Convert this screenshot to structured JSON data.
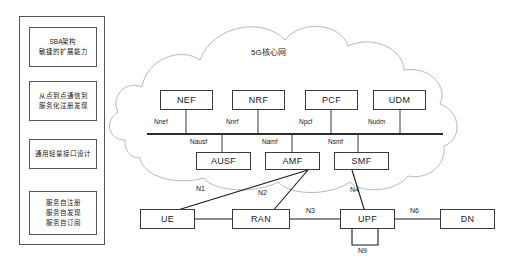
{
  "diagram": {
    "cloud_label": "5G核心网",
    "stroke_color": "#3a3a3a",
    "cloud_color": "#b9b9b9"
  },
  "side_panel": {
    "items": [
      {
        "text": "SBA架构\n敏捷的扩展能力"
      },
      {
        "text": "从点到点通信到\n服务化注册发现"
      },
      {
        "text": "通用轻量接口设计"
      },
      {
        "text": "服务自注册\n服务自发现\n服务自订阅"
      }
    ]
  },
  "core_network": {
    "top_functions": [
      {
        "name": "NEF",
        "interface": "Nnef"
      },
      {
        "name": "NRF",
        "interface": "Nnrf"
      },
      {
        "name": "PCF",
        "interface": "Npcf"
      },
      {
        "name": "UDM",
        "interface": "Nudm"
      }
    ],
    "bottom_functions": [
      {
        "name": "AUSF",
        "interface": "Nausf"
      },
      {
        "name": "AMF",
        "interface": "Namf"
      },
      {
        "name": "SMF",
        "interface": "Nsmf"
      }
    ]
  },
  "access_plane": {
    "nodes": [
      {
        "name": "UE"
      },
      {
        "name": "RAN"
      },
      {
        "name": "UPF"
      },
      {
        "name": "DN"
      }
    ],
    "reference_points": [
      {
        "name": "N1"
      },
      {
        "name": "N2"
      },
      {
        "name": "N3"
      },
      {
        "name": "N4"
      },
      {
        "name": "N6"
      },
      {
        "name": "N9"
      }
    ]
  }
}
